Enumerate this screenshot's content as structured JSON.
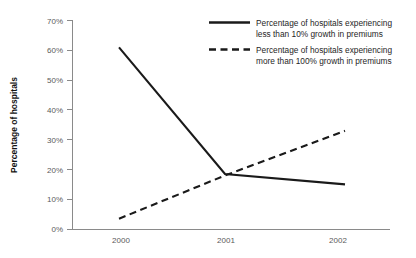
{
  "chart_data": {
    "type": "line",
    "title": "",
    "subtitle": "",
    "xlabel": "",
    "ylabel": "Percentage of hospitals",
    "categories": [
      "2000",
      "2001",
      "2002"
    ],
    "x": [
      2000,
      2001,
      2002
    ],
    "ylim": [
      0,
      70
    ],
    "ytick_values": [
      0,
      10,
      20,
      30,
      40,
      50,
      60,
      70
    ],
    "ytick_labels": [
      "0%",
      "10%",
      "20%",
      "30%",
      "40%",
      "50%",
      "60%",
      "70%"
    ],
    "xtick_labels": [
      "2000",
      "2001",
      "2002"
    ],
    "grid": false,
    "legend_position": "top-right",
    "series": [
      {
        "name": "Percentage of hospitals experiencing less than 10% growth in premiums",
        "legend_line1": "Percentage of hospitals experiencing",
        "legend_line2": "less than 10% growth in premiums",
        "style": "solid",
        "color": "#1a1a1a",
        "values": [
          61,
          18.5,
          15
        ]
      },
      {
        "name": "Percentage of hospitals experiencing more than 100% growth in premiums",
        "legend_line1": "Percentage of hospitals experiencing",
        "legend_line2": "more than 100% growth in premiums",
        "style": "dashed",
        "color": "#1a1a1a",
        "values": [
          3.5,
          18,
          33
        ]
      }
    ]
  },
  "axis": {
    "y_title": "Percentage of hospitals",
    "ticks_y": [
      "70%",
      "60%",
      "50%",
      "40%",
      "30%",
      "20%",
      "10%",
      "0%"
    ],
    "ticks_x": [
      "2000",
      "2001",
      "2002"
    ]
  },
  "legend": {
    "entries": [
      {
        "line1": "Percentage of hospitals experiencing",
        "line2": "less than 10% growth in premiums"
      },
      {
        "line1": "Percentage of hospitals experiencing",
        "line2": "more than 100% growth in premiums"
      }
    ]
  },
  "colors": {
    "series": "#1a1a1a",
    "axis": "#8a8a8a",
    "tick_text": "#5a5a5a",
    "legend_text": "#262626",
    "background": "#ffffff"
  }
}
